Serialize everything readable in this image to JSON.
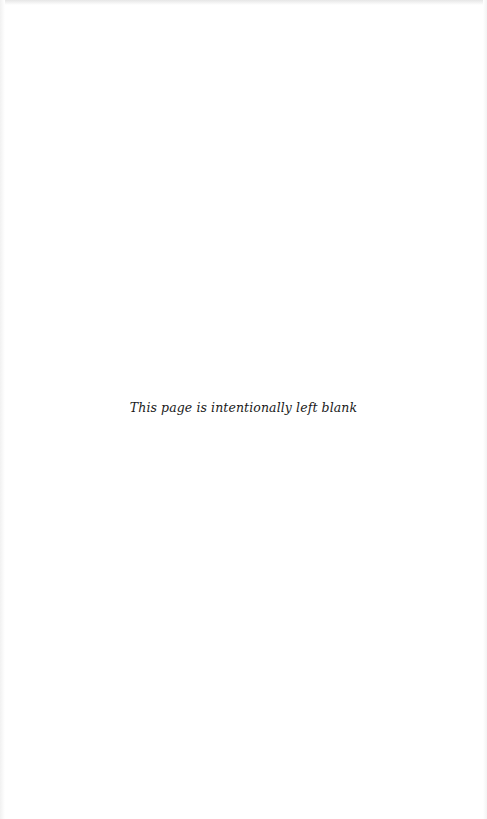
{
  "page": {
    "notice": "This page is intentionally left blank"
  },
  "colors": {
    "background": "#ffffff",
    "text": "#1a1a1a"
  }
}
